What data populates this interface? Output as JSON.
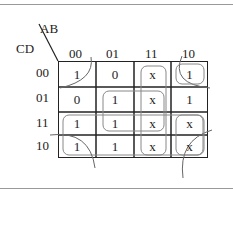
{
  "kmap": {
    "row_var": "CD",
    "col_var": "AB",
    "col_labels": [
      "00",
      "01",
      "11",
      "10"
    ],
    "row_labels": [
      "00",
      "01",
      "11",
      "10"
    ],
    "cells": [
      [
        "1",
        "0",
        "x",
        "1"
      ],
      [
        "0",
        "1",
        "x",
        "1"
      ],
      [
        "1",
        "1",
        "x",
        "x"
      ],
      [
        "1",
        "1",
        "x",
        "x"
      ]
    ]
  }
}
